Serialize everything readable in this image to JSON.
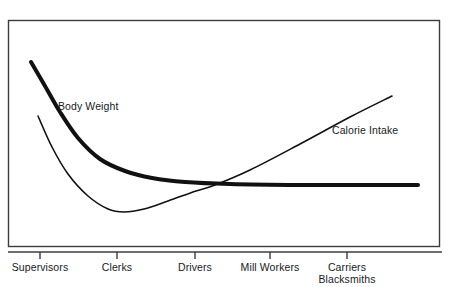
{
  "figure": {
    "background_color": "#ffffff",
    "frame_color": "#3c3c3c",
    "ink_color": "#111111"
  },
  "chart_data": {
    "type": "line",
    "title": "",
    "subtitle": "",
    "xlabel": "",
    "ylabel": "",
    "grid": false,
    "legend_position": "inline-annotation",
    "axis": {
      "x_categories": [
        "Supervisors",
        "Clerks",
        "Drivers",
        "Mill Workers",
        "Carriers Blacksmiths"
      ],
      "x_tick_positions": [
        40,
        117,
        195,
        270,
        347
      ],
      "y_axis_shown": false,
      "y_tick_labels": [],
      "ylim": [
        0,
        100
      ],
      "xlim": [
        0,
        5
      ]
    },
    "series": [
      {
        "name": "Body Weight",
        "style": "thick",
        "stroke_width": 4,
        "color": "#111111",
        "annotation": "Body Weight",
        "annotation_x": 58,
        "annotation_y": 110,
        "points": [
          {
            "x": 31,
            "y": 62
          },
          {
            "x": 45,
            "y": 86
          },
          {
            "x": 60,
            "y": 112
          },
          {
            "x": 78,
            "y": 138
          },
          {
            "x": 100,
            "y": 159
          },
          {
            "x": 125,
            "y": 171
          },
          {
            "x": 152,
            "y": 178
          },
          {
            "x": 185,
            "y": 182
          },
          {
            "x": 230,
            "y": 184
          },
          {
            "x": 300,
            "y": 185
          },
          {
            "x": 360,
            "y": 185
          },
          {
            "x": 418,
            "y": 185
          }
        ]
      },
      {
        "name": "Calorie Intake",
        "style": "thin",
        "stroke_width": 1.6,
        "color": "#111111",
        "annotation": "Calorie Intake",
        "annotation_x": 332,
        "annotation_y": 134,
        "points": [
          {
            "x": 38,
            "y": 116
          },
          {
            "x": 52,
            "y": 147
          },
          {
            "x": 68,
            "y": 174
          },
          {
            "x": 88,
            "y": 196
          },
          {
            "x": 108,
            "y": 209
          },
          {
            "x": 124,
            "y": 212
          },
          {
            "x": 144,
            "y": 209
          },
          {
            "x": 168,
            "y": 201
          },
          {
            "x": 196,
            "y": 191
          },
          {
            "x": 215,
            "y": 185
          },
          {
            "x": 250,
            "y": 170
          },
          {
            "x": 300,
            "y": 144
          },
          {
            "x": 350,
            "y": 117
          },
          {
            "x": 392,
            "y": 96
          }
        ]
      }
    ],
    "crossover_point": {
      "x": 215,
      "y": 185
    },
    "calorie_minimum": {
      "x": 124,
      "y": 212
    }
  },
  "labels": {
    "body_weight": "Body Weight",
    "calorie_intake": "Calorie Intake",
    "ticks": [
      {
        "line1": "Supervisors",
        "line2": ""
      },
      {
        "line1": "Clerks",
        "line2": ""
      },
      {
        "line1": "Drivers",
        "line2": ""
      },
      {
        "line1": "Mill Workers",
        "line2": ""
      },
      {
        "line1": "Carriers",
        "line2": "Blacksmiths"
      }
    ]
  }
}
